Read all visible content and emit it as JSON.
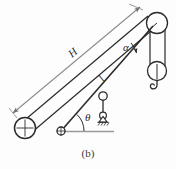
{
  "figure": {
    "caption": "(b)",
    "title_label": "(b)",
    "labels": {
      "height_dimension": "H",
      "boom_length": "l",
      "boom_angle": "θ",
      "cable_angle": "α"
    },
    "colors": {
      "line": "#2b2b2b",
      "dimension_line": "#8a8a8a",
      "ground_line": "#9a9a9a",
      "background": "#fdfdfd",
      "text": "#2b2b2b"
    },
    "components": [
      {
        "name": "left-wheel",
        "type": "wheel-with-cross",
        "cx": 25,
        "cy": 128,
        "r": 10
      },
      {
        "name": "boom-pivot",
        "type": "pin-joint",
        "cx": 61,
        "cy": 131,
        "r": 4
      },
      {
        "name": "mast-top-pulley",
        "type": "pulley",
        "cx": 157,
        "cy": 23,
        "r": 10
      },
      {
        "name": "lower-block-pulley",
        "type": "pulley",
        "cx": 157,
        "cy": 71,
        "r": 9
      },
      {
        "name": "load-hook",
        "type": "hook",
        "cx": 157,
        "cy": 85
      },
      {
        "name": "boom-mid-joint",
        "type": "pin-joint",
        "cx": 103,
        "cy": 96,
        "r": 4
      },
      {
        "name": "ground-support",
        "type": "pin-support-hatched",
        "cx": 103,
        "cy": 118
      },
      {
        "name": "ground-line",
        "type": "line",
        "x1": 57,
        "y1": 131,
        "x2": 114,
        "y2": 131
      }
    ],
    "dimension": {
      "name": "H",
      "from": {
        "x": 12,
        "y": 112
      },
      "to": {
        "x": 141,
        "y": 6
      },
      "arrowheads": "both"
    },
    "angles": [
      {
        "name": "alpha",
        "symbol": "α",
        "vertex_x": 147,
        "vertex_y": 34,
        "label_x": 126,
        "label_y": 49
      },
      {
        "name": "theta",
        "symbol": "θ",
        "vertex_x": 61,
        "vertex_y": 131,
        "label_x": 86,
        "label_y": 120
      }
    ]
  }
}
